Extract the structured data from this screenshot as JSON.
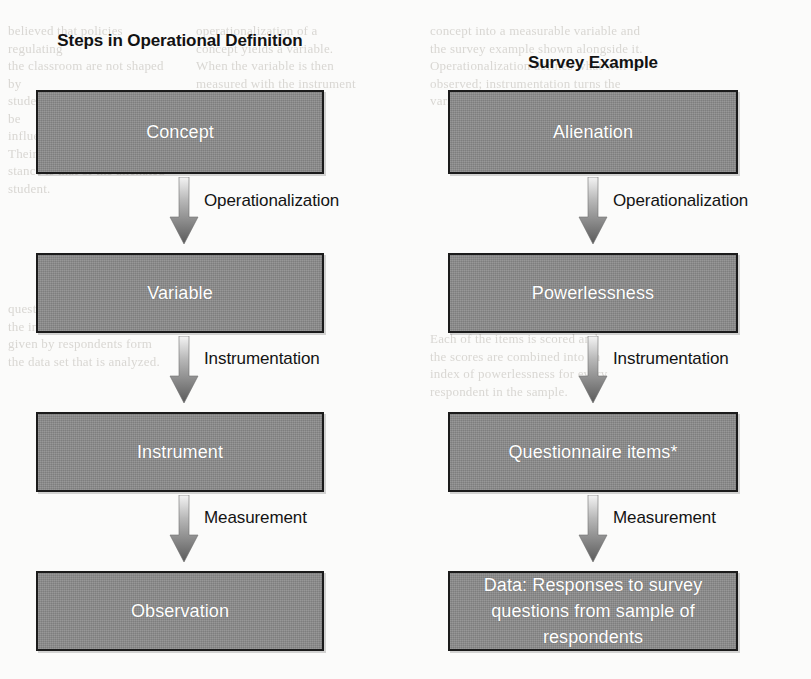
{
  "figure": {
    "columns": [
      {
        "id": "operational-definition",
        "title": "Steps in Operational\nDefinition",
        "boxes": [
          {
            "label": "Concept"
          },
          {
            "label": "Variable"
          },
          {
            "label": "Instrument"
          },
          {
            "label": "Observation"
          }
        ],
        "steps": [
          {
            "label": "Operationalization"
          },
          {
            "label": "Instrumentation"
          },
          {
            "label": "Measurement"
          }
        ]
      },
      {
        "id": "survey-example",
        "title": "Survey Example",
        "boxes": [
          {
            "label": "Alienation"
          },
          {
            "label": "Powerlessness"
          },
          {
            "label": "Questionnaire items*"
          },
          {
            "label": "Data: Responses to survey\nquestions from sample of\nrespondents"
          }
        ],
        "steps": [
          {
            "label": "Operationalization"
          },
          {
            "label": "Instrumentation"
          },
          {
            "label": "Measurement"
          }
        ]
      }
    ],
    "colors": {
      "box_fill": "#8c8c8c",
      "box_border": "#1b1b1b",
      "box_text": "#ffffff",
      "label_text": "#131313",
      "arrow_light": "#f2f2f2",
      "arrow_dark": "#5c5c5c",
      "page_background": "#fbfbfa"
    },
    "background_bleed": {
      "left": "believed that policies regulating\nthe classroom are not shaped by\nstudent concerns and cannot be\ninfluenced by student effort. Their\nstance is that of the alienated\nstudent.",
      "mid": "operationalization of a\nconcept yields a variable.\nWhen the variable is then\nmeasured with the instrument\nthe result is a set of\nobservations or data.",
      "right": "concept into a measurable variable and\nthe survey example shown alongside it.\nOperationalization defines what will be\nobserved; instrumentation turns the\nvariable into questionnaire items.",
      "low_left": "questions of the survey are\nthe instrument; the answers\ngiven by respondents form\nthe data set that is analyzed.",
      "low_right": "Each of the items is scored and\nthe scores are combined into an\nindex of powerlessness for every\nrespondent in the sample."
    }
  }
}
